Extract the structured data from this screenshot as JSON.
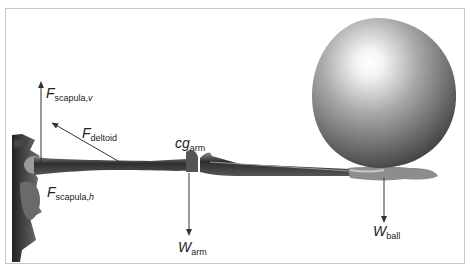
{
  "diagram": {
    "labels": {
      "f_scapula_v": {
        "main": "F",
        "sub": "scapula,",
        "sub_italic": "v"
      },
      "f_deltoid": {
        "main": "F",
        "sub": "deltoid"
      },
      "f_scapula_h": {
        "main": "F",
        "sub": "scapula,",
        "sub_italic": "h"
      },
      "cg_arm": {
        "main": "cg",
        "sub": "arm"
      },
      "w_arm": {
        "main": "W",
        "sub": "arm"
      },
      "w_ball": {
        "main": "W",
        "sub": "ball"
      }
    },
    "colors": {
      "arrow": "#333333",
      "bone": "#3a3a3a",
      "ball_light": "#ffffff",
      "ball_dark": "#4a4a4a",
      "frame_border": "#c8c8c8"
    }
  }
}
